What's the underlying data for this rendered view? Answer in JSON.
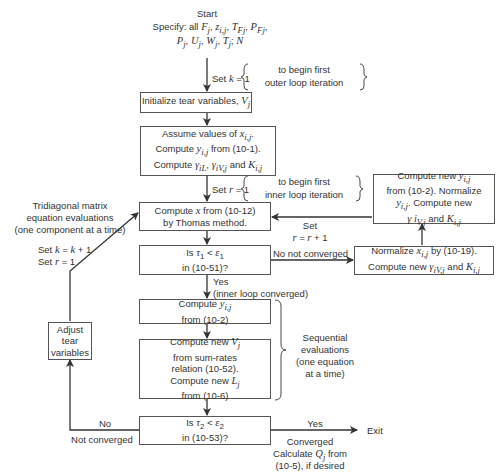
{
  "start": {
    "label": "Start",
    "specify_line1": "Specify: all F_j, z_i,j, T_Fj, P_Fj,",
    "specify_line2": "P_j, U_j, W_j, T_j; N"
  },
  "set_k": {
    "label": "Set k = 1",
    "note_line1": "to begin first",
    "note_line2": "outer loop iteration"
  },
  "init_box": {
    "text": "Initialize tear variables, V_j"
  },
  "assume_box": {
    "line1": "Assume values of x_i,j.",
    "line2": "Compute y_i,j from (10-1).",
    "line3": "Compute γ_iL, γ_iV,j and K_i,j"
  },
  "set_r": {
    "label": "Set r = 1",
    "note_line1": "to begin first",
    "note_line2": "inner loop iteration"
  },
  "thomas_box": {
    "line1": "Compute x from (10-12)",
    "line2": "by Thomas method."
  },
  "tridiagonal_note": {
    "line1": "Tridiagonal matrix",
    "line2": "equation evaluations",
    "line3": "(one component at a time)"
  },
  "tau1_box": {
    "line1": "Is τ1 < ε1",
    "line2": "in (10-51)?"
  },
  "no_not_converged": "No not converged",
  "yes_inner": {
    "line1": "Yes",
    "line2": "(inner loop converged)"
  },
  "normalize_box": {
    "line1": "Normalize x_i,j by (10-19).",
    "line2": "Compute new γ_iV,j and K_i,j"
  },
  "right_box": {
    "line1": "Compute new y_i,j",
    "line2": "from (10-2). Normalize",
    "line3": "y_i,j. Compute new",
    "line4": "γ i_V,j and K_i,j"
  },
  "set_r_inc": {
    "line1": "Set",
    "line2": "r = r + 1"
  },
  "compute_y_box": {
    "line1": "Compute y_i,j",
    "line2": "from (10-2)"
  },
  "compute_v_box": {
    "line1": "Compute new V_j",
    "line2": "from sum-rates",
    "line3": "relation (10-52).",
    "line4": "Compute new L_j",
    "line5": "from (10-6)"
  },
  "sequential_note": {
    "line1": "Sequential",
    "line2": "evaluations",
    "line3": "(one equation",
    "line4": "at a time)"
  },
  "tau2_box": {
    "line1": "Is τ2 < ε2",
    "line2": "in (10-53)?"
  },
  "no_label": "No",
  "not_converged": "Not converged",
  "yes_label": "Yes",
  "exit_label": "Exit",
  "converged_note": {
    "line1": "Converged",
    "line2": "Calculate Q_j from",
    "line3": "(10-5), if desired"
  },
  "adjust_box": {
    "line1": "Adjust",
    "line2": "tear",
    "line3": "variables"
  },
  "set_k_inc": {
    "line1": "Set k = k + 1",
    "line2": "Set r = 1"
  }
}
